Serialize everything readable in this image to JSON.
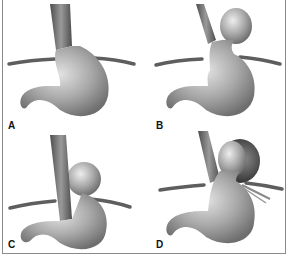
{
  "figure": {
    "panels": [
      {
        "id": "A",
        "label": "A",
        "hernia": "none"
      },
      {
        "id": "B",
        "label": "B",
        "hernia": "fundus-above-diaphragm"
      },
      {
        "id": "C",
        "label": "C",
        "hernia": "paraesophageal"
      },
      {
        "id": "D",
        "label": "D",
        "hernia": "large-paraesophageal-with-sac"
      }
    ]
  },
  "colors": {
    "stomach": "#9a9a9a",
    "stomach_highlight": "#d8d8d8",
    "diaphragm": "#5e5e5e",
    "esophagus": "#6a6a6a",
    "frame": "#8a8a8a"
  }
}
